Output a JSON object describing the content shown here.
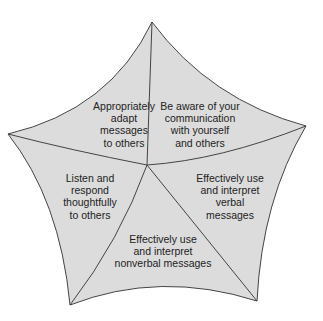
{
  "diagram": {
    "type": "pentagon-star",
    "fill_color": "#dcdcdc",
    "stroke_color": "#444444",
    "segments": [
      {
        "id": "adapt",
        "label": "Appropriately\nadapt\nmessages\nto others"
      },
      {
        "id": "aware",
        "label": "Be aware of your\ncommunication\nwith yourself\nand others"
      },
      {
        "id": "listen",
        "label": "Listen and\nrespond\nthoughtfully\nto others"
      },
      {
        "id": "verbal",
        "label": "Effectively use\nand interpret\nverbal\nmessages"
      },
      {
        "id": "nonverbal",
        "label": "Effectively use\nand interpret\nnonverbal messages"
      }
    ]
  }
}
